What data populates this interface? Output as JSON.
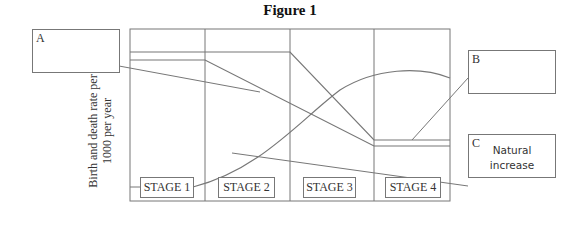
{
  "title": "Figure 1",
  "y_axis_label": {
    "line1": "Birth and death rate per",
    "line2": "1000 per year"
  },
  "stages": [
    {
      "label": "STAGE 1"
    },
    {
      "label": "STAGE 2"
    },
    {
      "label": "STAGE 3"
    },
    {
      "label": "STAGE 4"
    }
  ],
  "callouts": {
    "a": {
      "letter": "A",
      "text": ""
    },
    "b": {
      "letter": "B",
      "text": ""
    },
    "c": {
      "letter": "C",
      "text_line1": "Natural",
      "text_line2": "increase"
    }
  },
  "colors": {
    "line": "#777777",
    "text": "#333333"
  }
}
